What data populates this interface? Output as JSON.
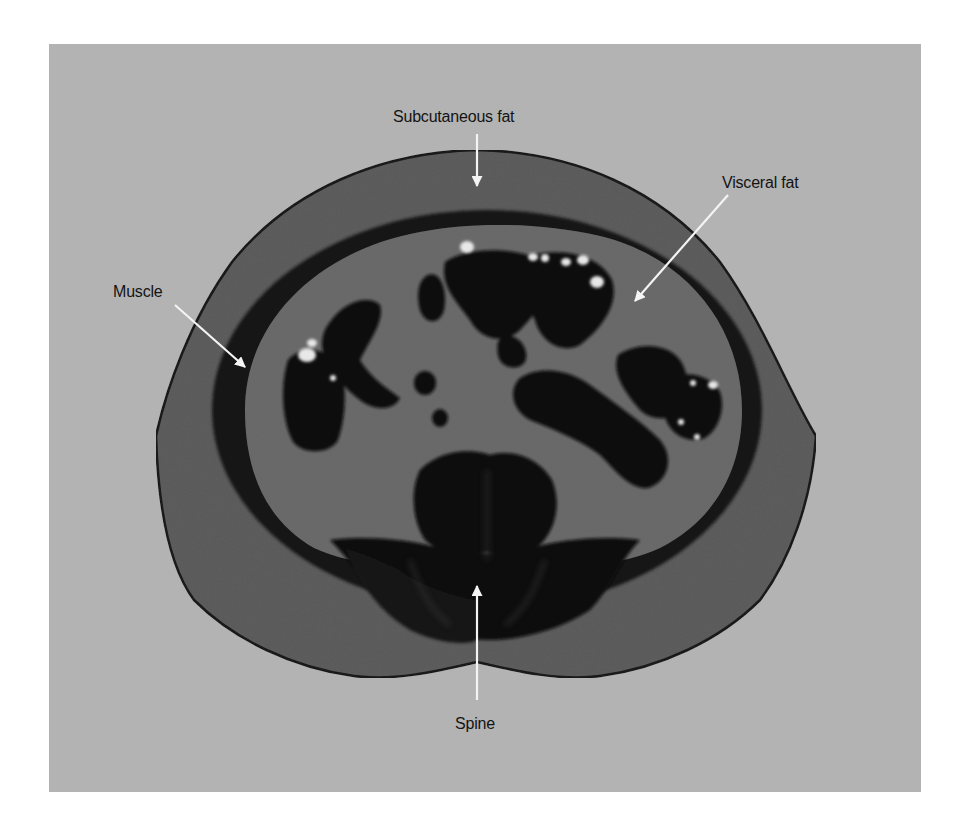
{
  "figure": {
    "type": "axial CT scan cross-section of abdomen",
    "background_color": "#b3b3b3",
    "tissue_colors": {
      "subcutaneous_fat": "#5a5a5a",
      "muscle": "#141414",
      "visceral_fat": "#6a6a6a",
      "bowel_gas": "#0c0c0c",
      "contrast": "#e6e6e6"
    }
  },
  "labels": [
    {
      "id": "subcutaneous-fat",
      "text": "Subcutaneous fat",
      "x": 393,
      "y": 108,
      "arrow": {
        "x1": 477,
        "y1": 134,
        "x2": 477,
        "y2": 186
      }
    },
    {
      "id": "visceral-fat",
      "text": "Visceral fat",
      "x": 722,
      "y": 174,
      "arrow": {
        "x1": 728,
        "y1": 195,
        "x2": 635,
        "y2": 301
      }
    },
    {
      "id": "muscle",
      "text": "Muscle",
      "x": 113,
      "y": 283,
      "arrow": {
        "x1": 175,
        "y1": 305,
        "x2": 245,
        "y2": 367
      }
    },
    {
      "id": "spine",
      "text": "Spine",
      "x": 455,
      "y": 715,
      "arrow": {
        "x1": 477,
        "y1": 700,
        "x2": 477,
        "y2": 586
      }
    }
  ]
}
